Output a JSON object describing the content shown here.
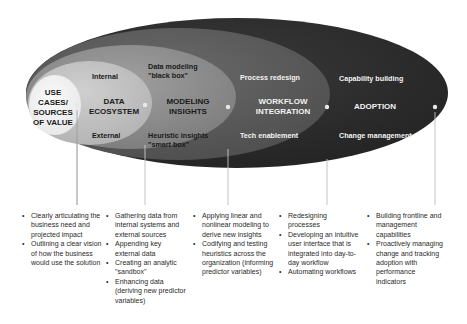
{
  "diagram": {
    "type": "nested-ellipses",
    "colors": {
      "adoption_ring": "#2e2e2e",
      "workflow_ring": "#5a5a5a",
      "modeling_ring": "#8a8a8a",
      "data_ring": "#bdbdbd",
      "use_cases_core": "#f2f2f2",
      "connector_line": "#bfbfbf",
      "dot": "#e6e6e6"
    },
    "layers": [
      {
        "title": "USE CASES/ SOURCES OF VALUE",
        "title_lines": [
          "USE",
          "CASES/",
          "SOURCES",
          "OF VALUE"
        ],
        "bullets": [
          "Clearly articulating the business need and projected impact",
          "Outlining a clear vision of how the business would use the solution"
        ]
      },
      {
        "title": "DATA ECOSYSTEM",
        "title_lines": [
          "DATA",
          "ECOSYSTEM"
        ],
        "sub_top": "Internal",
        "sub_bottom": "External",
        "bullets": [
          "Gathering data from internal systems and external sources",
          "Appending key external data",
          "Creating an analytic \"sandbox\"",
          "Enhancing data (deriving new predictor variables)"
        ]
      },
      {
        "title": "MODELING INSIGHTS",
        "title_lines": [
          "MODELING",
          "INSIGHTS"
        ],
        "sub_top_lines": [
          "Data modeling",
          "\"black box\""
        ],
        "sub_bottom_lines": [
          "Heuristic insights",
          "\"smart box\""
        ],
        "bullets": [
          "Applying linear and nonlinear modeling to derive new insights",
          "Codifying and testing heuristics across the organization (informing predictor variables)"
        ]
      },
      {
        "title": "WORKFLOW INTEGRATION",
        "title_lines": [
          "WORKFLOW",
          "INTEGRATION"
        ],
        "sub_top": "Process redesign",
        "sub_bottom": "Tech enablement",
        "bullets": [
          "Redesigning processes",
          "Developing an intuitive user interface that is integrated into day-to-day workflow",
          "Automating workflows"
        ]
      },
      {
        "title": "ADOPTION",
        "title_lines": [
          "ADOPTION"
        ],
        "sub_top": "Capability building",
        "sub_bottom": "Change management",
        "bullets": [
          "Building frontline and management capabilities",
          "Proactively managing change and tracking adoption with performance indicators"
        ]
      }
    ]
  }
}
